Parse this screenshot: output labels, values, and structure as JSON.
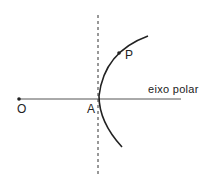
{
  "diagram": {
    "labels": {
      "origin": "O",
      "vertex": "A",
      "point": "P",
      "axis": "eixo polar"
    },
    "colors": {
      "stroke": "#222222",
      "axis": "#555555",
      "background": "#ffffff"
    }
  }
}
